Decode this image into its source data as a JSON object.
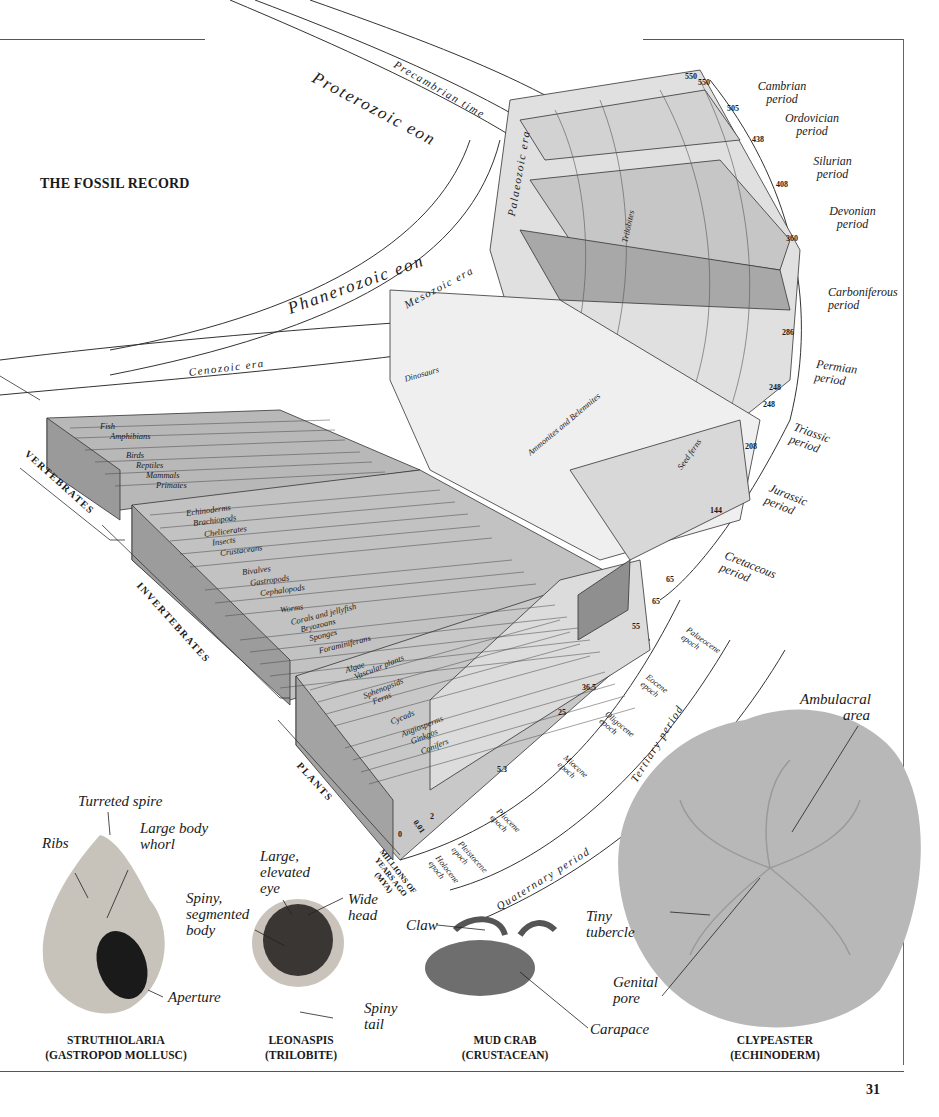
{
  "page": {
    "title": "THE FOSSIL RECORD",
    "page_number": "31"
  },
  "timescale": {
    "eons": [
      "Proterozoic eon",
      "Phanerozoic eon"
    ],
    "precambrian": "Precambrian time",
    "eras": [
      "Palaeozoic era",
      "Mesozoic era",
      "Cenozoic era"
    ],
    "periods": [
      {
        "name": "Cambrian period",
        "start_mya": "550"
      },
      {
        "name": "Ordovician period",
        "start_mya": "505"
      },
      {
        "name": "Silurian period",
        "start_mya": "438"
      },
      {
        "name": "Devonian period",
        "start_mya": "408"
      },
      {
        "name": "Carboniferous period",
        "start_mya": "360"
      },
      {
        "name": "Permian period",
        "start_mya": "286"
      },
      {
        "name": "Triassic period",
        "start_mya": "248"
      },
      {
        "name": "Jurassic period",
        "start_mya": "208"
      },
      {
        "name": "Cretaceous period",
        "start_mya": "144"
      },
      {
        "name": "Tertiary period",
        "start_mya": "65"
      },
      {
        "name": "Quaternary period",
        "start_mya": "2"
      }
    ],
    "epochs": [
      {
        "name": "Palaeocene epoch",
        "start_mya": "65"
      },
      {
        "name": "Eocene epoch",
        "start_mya": "55"
      },
      {
        "name": "Oligocene epoch",
        "start_mya": "36.5"
      },
      {
        "name": "Miocene epoch",
        "start_mya": "25"
      },
      {
        "name": "Pliocene epoch",
        "start_mya": "5.3"
      },
      {
        "name": "Pleistocene epoch",
        "start_mya": "2"
      },
      {
        "name": "Holocene epoch",
        "start_mya": "0.01"
      }
    ],
    "ticks": [
      "550",
      "550",
      "505",
      "438",
      "408",
      "360",
      "286",
      "248",
      "248",
      "208",
      "144",
      "65",
      "65",
      "55",
      "36.5",
      "25",
      "5.3",
      "2",
      "0.01",
      "0"
    ],
    "axis_label": "MILLIONS OF YEARS AGO (MYA)"
  },
  "groups": {
    "vertebrates": {
      "label": "VERTEBRATES",
      "items": [
        "Fish",
        "Amphibians",
        "Birds",
        "Reptiles",
        "Mammals",
        "Primates"
      ]
    },
    "invertebrates": {
      "label": "INVERTEBRATES",
      "items": [
        "Echinoderms",
        "Brachiopods",
        "Chelicerates",
        "Insects",
        "Crustaceans",
        "Bivalves",
        "Gastropods",
        "Cephalopods",
        "Worms",
        "Corals and jellyfish",
        "Bryozoans",
        "Sponges",
        "Foraminiferans"
      ]
    },
    "plants": {
      "label": "PLANTS",
      "items": [
        "Algae",
        "Vascular plants",
        "Sphenopsids",
        "Ferns",
        "Cycads",
        "Angiosperms",
        "Ginkgos",
        "Conifers"
      ]
    },
    "extinct_labels": [
      "Dinosaurs",
      "Ammonites and Belemnites",
      "Trilobites",
      "Seed ferns"
    ]
  },
  "fossils": [
    {
      "name": "STRUTHIOLARIA",
      "type": "(GASTROPOD MOLLUSC)",
      "labels": [
        "Turreted spire",
        "Ribs",
        "Large body whorl",
        "Aperture"
      ]
    },
    {
      "name": "LEONASPIS",
      "type": "(TRILOBITE)",
      "labels": [
        "Large, elevated eye",
        "Spiny, segmented body",
        "Wide head",
        "Spiny tail"
      ]
    },
    {
      "name": "MUD CRAB",
      "type": "(CRUSTACEAN)",
      "labels": [
        "Claw",
        "Carapace"
      ]
    },
    {
      "name": "CLYPEASTER",
      "type": "(ECHINODERM)",
      "labels": [
        "Ambulacral area",
        "Tiny tubercle",
        "Genital pore"
      ]
    }
  ],
  "colors": {
    "band_dark": "#9c9c9c",
    "band_mid": "#c4c4c4",
    "band_light": "#e6e6e6",
    "band_white": "#f6f6f6",
    "line": "#333333"
  }
}
